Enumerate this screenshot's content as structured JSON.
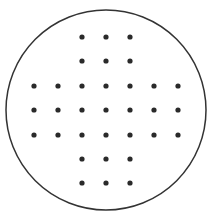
{
  "diagram": {
    "title": "",
    "type": "peg-solitaire-board",
    "board_outline": {
      "shape": "circle",
      "cx": 106,
      "cy": 110,
      "r": 100,
      "stroke": "#333333"
    },
    "hole_color": "#2a2a2a",
    "columns_x": [
      34,
      58,
      82,
      106,
      130,
      154,
      178
    ],
    "rows_y": [
      37,
      61,
      86,
      110,
      135,
      159,
      183
    ],
    "rows": [
      [
        0,
        0,
        1,
        1,
        1,
        0,
        0
      ],
      [
        0,
        0,
        1,
        1,
        1,
        0,
        0
      ],
      [
        1,
        1,
        1,
        1,
        1,
        1,
        1
      ],
      [
        1,
        1,
        1,
        1,
        1,
        1,
        1
      ],
      [
        1,
        1,
        1,
        1,
        1,
        1,
        1
      ],
      [
        0,
        0,
        1,
        1,
        1,
        0,
        0
      ],
      [
        0,
        0,
        1,
        1,
        1,
        0,
        0
      ]
    ],
    "hole_count": 33
  }
}
